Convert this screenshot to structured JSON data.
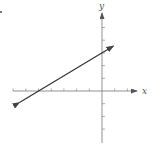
{
  "chart_data": {
    "type": "line",
    "title": "",
    "xlabel": "x",
    "ylabel": "y",
    "xlim": [
      -7,
      2
    ],
    "ylim": [
      -4,
      6
    ],
    "grid": false,
    "tick_spacing": 1,
    "x_ticks": [
      -7,
      -6,
      -5,
      -4,
      -3,
      -2,
      -1,
      1,
      2
    ],
    "y_ticks": [
      -3,
      -2,
      -1,
      1,
      2,
      3,
      4,
      5
    ],
    "series": [
      {
        "name": "line",
        "equation": "y = (3/5)x + 3",
        "slope": 0.6,
        "y_intercept": 3,
        "x_intercept": -5,
        "x": [
          -6.5,
          0.9
        ],
        "y": [
          -0.9,
          3.54
        ],
        "arrows_both_ends": true,
        "color": "#333333"
      }
    ]
  },
  "labels": {
    "x_axis": "x",
    "y_axis": "y"
  },
  "colors": {
    "axis": "#666666",
    "line": "#333333",
    "background": "#ffffff"
  }
}
